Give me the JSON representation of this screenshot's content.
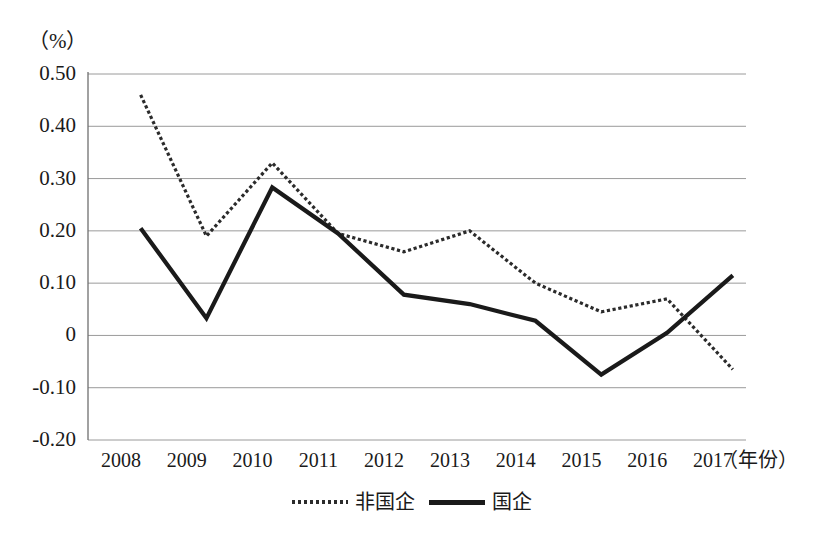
{
  "chart_data": {
    "type": "line",
    "title": "",
    "xlabel": "（年份）",
    "ylabel": "（%）",
    "categories": [
      "2008",
      "2009",
      "2010",
      "2011",
      "2012",
      "2013",
      "2014",
      "2015",
      "2016",
      "2017"
    ],
    "ylim": [
      -0.2,
      0.5
    ],
    "yticks": [
      "0.50",
      "0.40",
      "0.30",
      "0.20",
      "0.10",
      "0",
      "-0.10",
      "-0.20"
    ],
    "ytick_values": [
      0.5,
      0.4,
      0.3,
      0.2,
      0.1,
      0,
      -0.1,
      -0.2
    ],
    "grid": true,
    "legend_position": "bottom",
    "series": [
      {
        "name": "非国企",
        "style": "dotted",
        "color": "#2b2b2b",
        "values": [
          0.46,
          0.19,
          0.33,
          0.195,
          0.16,
          0.2,
          0.1,
          0.045,
          0.07,
          -0.065
        ]
      },
      {
        "name": "国企",
        "style": "solid",
        "color": "#1a1a1a",
        "values": [
          0.205,
          0.033,
          0.283,
          0.195,
          0.078,
          0.06,
          0.028,
          -0.075,
          0.005,
          0.115
        ]
      }
    ]
  },
  "axis": {
    "unit_label": "（%）",
    "x_title": "（年份）"
  },
  "geometry": {
    "plot_left": 88,
    "plot_right": 746,
    "y_top_px": 74,
    "y_bottom_px": 440,
    "y_top_value": 0.5,
    "y_bottom_value": -0.2,
    "point_offset_frac": 0.3
  },
  "colors": {
    "gridline": "#9a9a9a",
    "axis": "#6f6f6f",
    "series_solid": "#1a1a1a",
    "series_dotted": "#2b2b2b",
    "background": "#ffffff"
  }
}
